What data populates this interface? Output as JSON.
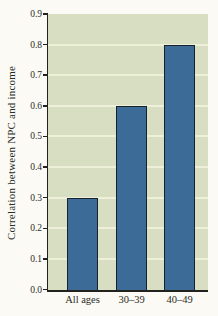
{
  "chart_data": {
    "type": "bar",
    "title": "",
    "categories": [
      "All ages",
      "30–39",
      "40–49"
    ],
    "values": [
      0.3,
      0.6,
      0.8
    ],
    "xlabel": "",
    "ylabel": "Correlation between NPC and income",
    "ylim": [
      0.0,
      0.9
    ],
    "ytick_step": 0.1,
    "yticks": [
      "0.0",
      "0.1",
      "0.2",
      "0.3",
      "0.4",
      "0.5",
      "0.6",
      "0.7",
      "0.8",
      "0.9"
    ],
    "grid": "horizontal-light",
    "legend": "none",
    "colors": {
      "page_background": "#fbfaf4",
      "plot_background": "#d8dec1",
      "gridline": "#eef0da",
      "bar_fill": "#3c6b97",
      "bar_border": "#16222e",
      "axis": "#22221f",
      "text": "#2b2b27"
    }
  }
}
